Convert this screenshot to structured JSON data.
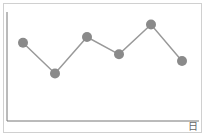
{
  "chart_data": {
    "type": "line",
    "title": "",
    "xlabel": "日",
    "ylabel": "",
    "categories": [
      "1",
      "2",
      "3",
      "4",
      "5",
      "6"
    ],
    "series": [
      {
        "name": "",
        "values": [
          70,
          38,
          76,
          58,
          89,
          51
        ]
      }
    ],
    "ylim": [
      0,
      100
    ],
    "grid": false,
    "legend": "none",
    "colors": {
      "line": "#999999",
      "marker": "#8a8a8a",
      "axis": "#777777",
      "frame": "#d0d0d0"
    }
  }
}
